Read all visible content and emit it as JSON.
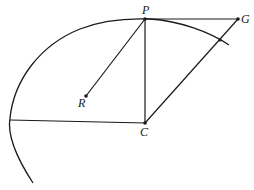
{
  "diagram": {
    "type": "geometric-construction",
    "stroke_color": "#1a1a1a",
    "background": "#ffffff",
    "points": [
      {
        "id": "P",
        "label": "P",
        "x": 145,
        "y": 19
      },
      {
        "id": "G",
        "label": "G",
        "x": 238,
        "y": 19
      },
      {
        "id": "R",
        "label": "R",
        "x": 86,
        "y": 96
      },
      {
        "id": "C",
        "label": "C",
        "x": 145,
        "y": 123
      }
    ],
    "segments": [
      {
        "from": "P",
        "to": "G"
      },
      {
        "from": "P",
        "to": "R"
      },
      {
        "from": "P",
        "to": "C"
      },
      {
        "from": "C",
        "to": "G"
      },
      {
        "from": "C",
        "to": "arc-left"
      }
    ],
    "curve": {
      "description": "arc passing through P, extending left/down and right past the C–G line"
    },
    "labels": {
      "P": "P",
      "G": "G",
      "R": "R",
      "C": "C"
    }
  }
}
